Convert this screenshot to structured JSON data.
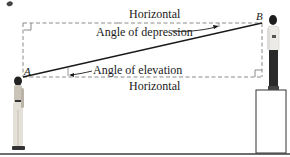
{
  "figure": {
    "top_fragment": "g",
    "labels": {
      "horizontal_top": "Horizontal",
      "horizontal_bottom": "Horizontal",
      "angle_depression": "Angle of depression",
      "angle_elevation": "Angle of elevation"
    },
    "points": {
      "a": "A",
      "b": "B"
    },
    "colors": {
      "line": "#1a1a1a",
      "dashed": "#8a8a8a",
      "ground": "#6e6e6e",
      "background": "#ffffff"
    }
  }
}
